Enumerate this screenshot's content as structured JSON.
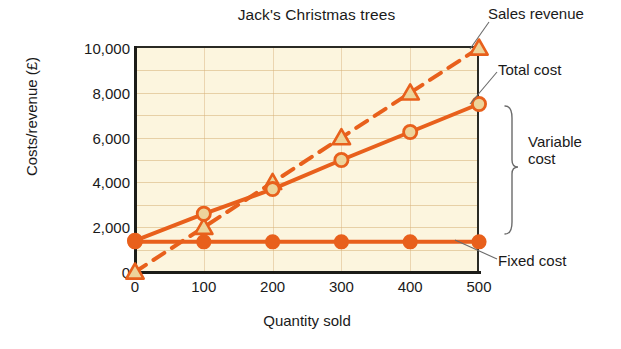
{
  "chart_data": {
    "type": "line",
    "title": "Jack's Christmas trees",
    "xlabel": "Quantity sold",
    "ylabel": "Costs/revenue (£)",
    "x": [
      0,
      100,
      200,
      300,
      400,
      500
    ],
    "xlim": [
      0,
      500
    ],
    "ylim": [
      0,
      10000
    ],
    "xticklabels": [
      "0",
      "100",
      "200",
      "300",
      "400",
      "500"
    ],
    "yticks": [
      0,
      2000,
      4000,
      6000,
      8000,
      10000
    ],
    "yticklabels": [
      "0",
      "2,000",
      "4,000",
      "6,000",
      "8,000",
      "10,000"
    ],
    "grid": "horizontal-faint",
    "legend": "inline-annotations-right",
    "series": [
      {
        "name": "Sales revenue",
        "values": [
          0,
          2000,
          4000,
          6000,
          8000,
          10000
        ],
        "style": "dashed",
        "marker": "triangle",
        "color": "#E8601C"
      },
      {
        "name": "Total cost",
        "values": [
          1400,
          2600,
          3700,
          5000,
          6250,
          7500
        ],
        "style": "solid",
        "marker": "circle",
        "color": "#E8601C"
      },
      {
        "name": "Fixed cost",
        "values": [
          1350,
          1350,
          1350,
          1350,
          1350,
          1350
        ],
        "style": "solid",
        "marker": "circle-filled",
        "color": "#E8601C"
      }
    ],
    "annotations": [
      {
        "text": "Sales revenue",
        "target": "sales-revenue-endpoint"
      },
      {
        "text": "Total cost",
        "target": "total-cost-endpoint"
      },
      {
        "text": "Fixed cost",
        "target": "fixed-cost-endpoint"
      },
      {
        "text": "Variable cost",
        "target": "gap-between-fixed-and-total",
        "shape": "curly-brace"
      }
    ]
  },
  "annotations": {
    "sales_revenue": "Sales revenue",
    "total_cost": "Total cost",
    "fixed_cost": "Fixed cost",
    "variable_cost_line1": "Variable",
    "variable_cost_line2": "cost"
  },
  "colors": {
    "line": "#E8601C",
    "marker_fill": "#EDD49B",
    "plot_background": "#FCF5DE",
    "axis": "#1c1c18",
    "grid": "#D6B078",
    "text": "#1a1a1a"
  }
}
